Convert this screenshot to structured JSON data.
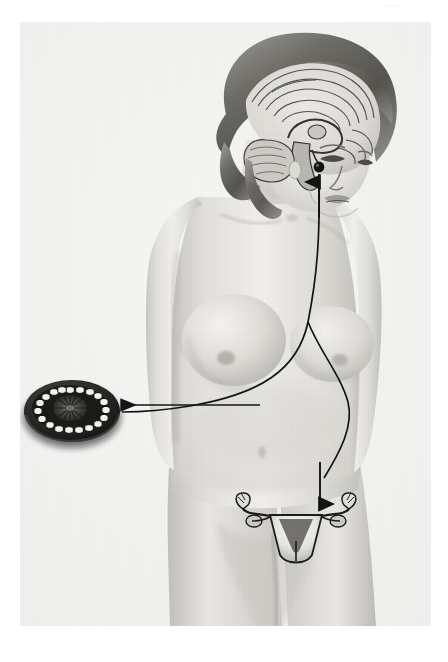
{
  "page": {
    "background_color": "#ffffff",
    "plate_background": "#f3f3f2",
    "ink_color": "#1a1a1a",
    "running_header": {
      "left_fragment": "·",
      "center_fragment": "··",
      "right_fragment": "——"
    },
    "caption_text": ""
  },
  "figure": {
    "rendering": "airbrush halftone, black and white"
  },
  "labels": {
    "brain": "brain-sagittal-section",
    "pituitary": "pituitary-gland",
    "cerebellum": "cerebellum",
    "corpus_callosum": "corpus-callosum",
    "ovary_inset": "ovary-cross-section",
    "follicles": "ovarian-follicles",
    "corpus_luteum": "corpus-luteum",
    "uterus": "uterus",
    "fallopian_tubes": "fallopian-tubes",
    "fimbriae": "fimbriae"
  },
  "annotations": {
    "arrow_pituitary_to_ovary": "curved arrow from pituitary down the torso to the ovary inset",
    "arrow_ovary_to_uterus": "curved arrow branching to the uterus",
    "arrow_up_to_pituitary": "straight arrow pointing up to pituitary gland",
    "arrow_down_to_uterus": "straight arrow pointing down to uterus"
  },
  "counts": {
    "follicle_count": 19
  },
  "geometry": {
    "plate_left": 20,
    "plate_top": 22,
    "plate_width": 411,
    "plate_height": 604
  }
}
